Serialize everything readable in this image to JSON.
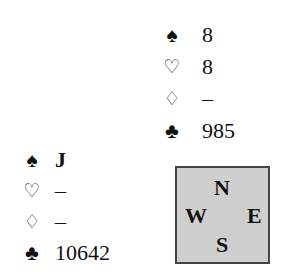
{
  "north": {
    "spades": "8",
    "hearts": "8",
    "diamonds": "–",
    "clubs": "985"
  },
  "west": {
    "spades": "J",
    "hearts": "–",
    "diamonds": "–",
    "clubs": "10642"
  },
  "suits": {
    "spades": "♠",
    "hearts": "♡",
    "diamonds": "♢",
    "clubs": "♣"
  },
  "compass": {
    "north": "N",
    "south": "S",
    "east": "E",
    "west": "W",
    "background": "#cfcfcf"
  }
}
